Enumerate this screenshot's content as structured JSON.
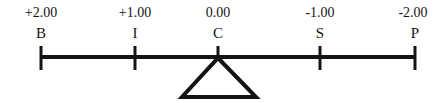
{
  "diagram": {
    "type": "lever-balance-number-line",
    "background_color": "#ffffff",
    "stroke_color": "#141414",
    "beam": {
      "x_start": 41,
      "x_end": 415,
      "y": 57,
      "thickness": 4
    },
    "fulcrum": {
      "shape": "triangle",
      "apex_x": 218,
      "apex_y": 58,
      "base_left_x": 182,
      "base_right_x": 256,
      "base_y": 97,
      "filled": false
    },
    "tick": {
      "top_y": 46,
      "bottom_y": 70,
      "width": 3
    },
    "points": [
      {
        "letter": "B",
        "value": "+2.00",
        "x": 41
      },
      {
        "letter": "I",
        "value": "+1.00",
        "x": 135
      },
      {
        "letter": "C",
        "value": "0.00",
        "x": 218
      },
      {
        "letter": "S",
        "value": "-1.00",
        "x": 320
      },
      {
        "letter": "P",
        "value": "-2.00",
        "x": 415
      }
    ]
  }
}
